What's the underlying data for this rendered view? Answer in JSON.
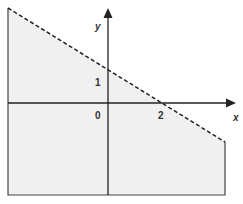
{
  "diagram": {
    "type": "linear-inequality-region",
    "axes": {
      "x_label": "x",
      "y_label": "y",
      "origin_label": "0"
    },
    "tick_labels": {
      "x_intercept": "2",
      "y_intercept": "1"
    },
    "boundary": {
      "style": "dashed",
      "x_intercept": 2,
      "y_intercept": 1
    },
    "colors": {
      "shade": "#f0f0f0",
      "line": "#222222",
      "border": "#444444"
    }
  }
}
